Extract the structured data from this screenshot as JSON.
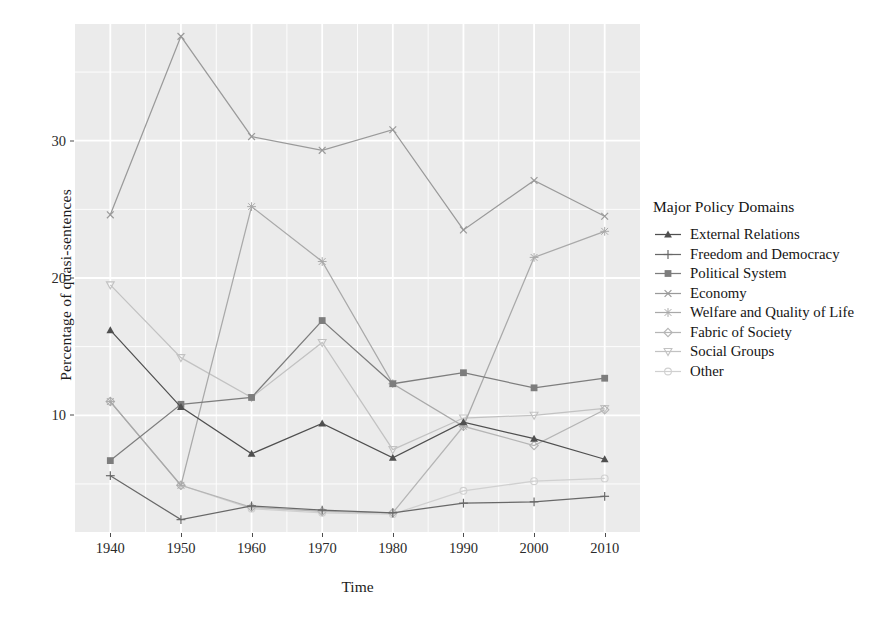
{
  "chart_data": {
    "type": "line",
    "title": "",
    "xlabel": "Time",
    "ylabel": "Percentage of quasi-sentences",
    "legend_title": "Major Policy Domains",
    "legend_position": "right",
    "grid": true,
    "x": [
      1940,
      1950,
      1960,
      1970,
      1980,
      1990,
      2000,
      2010
    ],
    "xtick_labels": [
      "1940",
      "1950",
      "1960",
      "1970",
      "1980",
      "1990",
      "2000",
      "2010"
    ],
    "ytick_labels": [
      "10",
      "20",
      "30"
    ],
    "yticks": [
      10,
      20,
      30
    ],
    "xlim": [
      1935,
      2015
    ],
    "ylim": [
      1.5,
      38.5
    ],
    "series": [
      {
        "name": "External Relations",
        "marker": "triangle",
        "color": "#4f4f4f",
        "values": [
          16.2,
          10.6,
          7.2,
          9.4,
          6.9,
          9.5,
          8.3,
          6.8
        ]
      },
      {
        "name": "Freedom and Democracy",
        "marker": "plus",
        "color": "#686868",
        "values": [
          5.6,
          2.4,
          3.4,
          3.1,
          2.9,
          3.6,
          3.7,
          4.1
        ]
      },
      {
        "name": "Political System",
        "marker": "square",
        "color": "#7d7d7d",
        "values": [
          6.7,
          10.8,
          11.3,
          16.9,
          12.3,
          13.1,
          12.0,
          12.7
        ]
      },
      {
        "name": "Economy",
        "marker": "cross",
        "color": "#9a9a9a",
        "values": [
          24.6,
          37.6,
          30.3,
          29.3,
          30.8,
          23.5,
          27.1,
          24.5
        ]
      },
      {
        "name": "Welfare and Quality of Life",
        "marker": "star",
        "color": "#a9a9a9",
        "values": [
          11.0,
          4.9,
          25.2,
          21.2,
          12.3,
          9.2,
          21.5,
          23.4
        ]
      },
      {
        "name": "Fabric of Society",
        "marker": "diamond",
        "color": "#b5b5b5",
        "values": [
          11.0,
          4.9,
          3.3,
          3.0,
          2.9,
          9.2,
          7.8,
          10.4
        ]
      },
      {
        "name": "Social Groups",
        "marker": "down-triangle",
        "color": "#c2c2c2",
        "values": [
          19.5,
          14.2,
          11.3,
          15.3,
          7.5,
          9.8,
          10.0,
          10.5
        ]
      },
      {
        "name": "Other",
        "marker": "circle-open",
        "color": "#d0d0d0",
        "values": [
          11.0,
          4.9,
          3.2,
          2.9,
          2.8,
          4.5,
          5.2,
          5.4
        ]
      }
    ]
  },
  "panel": {
    "background": "#ebebeb",
    "gridline_color": "#ffffff"
  }
}
